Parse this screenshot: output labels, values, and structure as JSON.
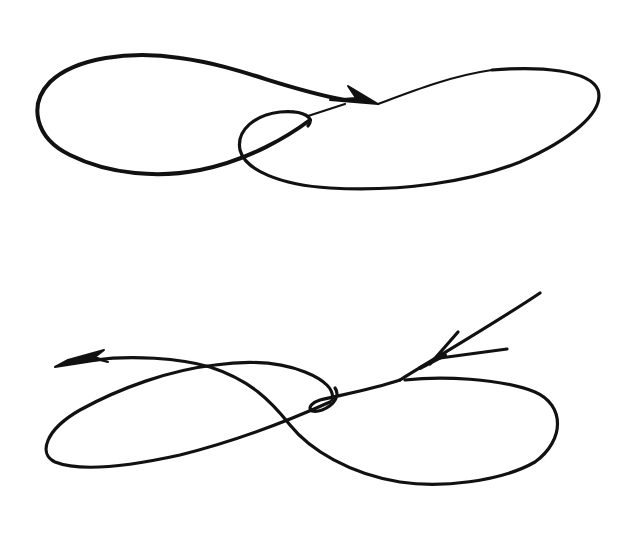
{
  "figure": {
    "background": "#ffffff",
    "ink_color": "#111111",
    "diagrams": [
      {
        "id": "top",
        "label": "Closed loop curve with arrow pointing right into the center",
        "shape": "double-lobed loop (left lobe and larger right lobe with small inner loop)",
        "arrow_direction": "right"
      },
      {
        "id": "bottom",
        "label": "Figure-eight curve entering from upper right, exiting to the left",
        "shape": "figure-eight with small loop near center",
        "arrow_direction": "left"
      }
    ]
  }
}
